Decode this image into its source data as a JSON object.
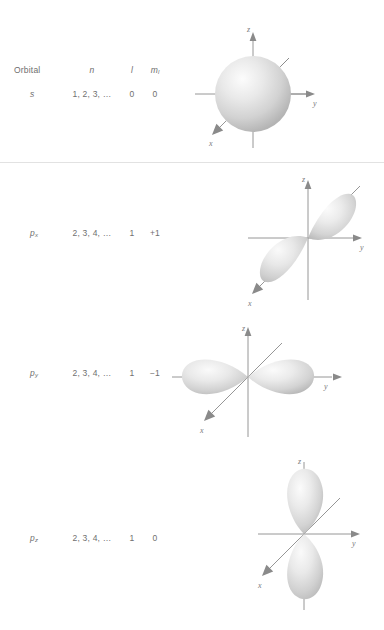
{
  "figure": {
    "background_color": "#ffffff",
    "text_color": "#6f6f6f",
    "axis_color": "#8a8a8a",
    "divider_color": "#e2e2e2"
  },
  "table": {
    "header": {
      "orbital": "Orbital",
      "n": "n",
      "l": "l",
      "ml": "m",
      "ml_sub": "l"
    },
    "rows": [
      {
        "orbital": "s",
        "orbital_sub": "",
        "n": "1, 2, 3, …",
        "l": "0",
        "ml": "0"
      },
      {
        "orbital": "p",
        "orbital_sub": "x",
        "n": "2, 3, 4, …",
        "l": "1",
        "ml": "+1"
      },
      {
        "orbital": "p",
        "orbital_sub": "y",
        "n": "2, 3, 4, …",
        "l": "1",
        "ml": "−1"
      },
      {
        "orbital": "p",
        "orbital_sub": "z",
        "n": "2, 3, 4, …",
        "l": "1",
        "ml": "0"
      }
    ]
  },
  "diagrams": [
    {
      "name": "s-orbital",
      "shape": "sphere",
      "axes": {
        "z": "z",
        "y": "y",
        "x": "x"
      }
    },
    {
      "name": "px-orbital",
      "shape": "dumbbell-diagonal",
      "axes": {
        "z": "z",
        "y": "y",
        "x": "x"
      }
    },
    {
      "name": "py-orbital",
      "shape": "dumbbell-horizontal",
      "axes": {
        "z": "z",
        "y": "y",
        "x": "x"
      }
    },
    {
      "name": "pz-orbital",
      "shape": "dumbbell-vertical",
      "axes": {
        "z": "z",
        "y": "y",
        "x": "x"
      }
    }
  ]
}
